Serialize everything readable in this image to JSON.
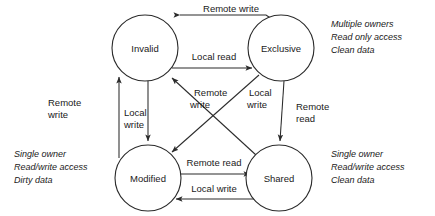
{
  "diagram": {
    "states": [
      {
        "id": "invalid",
        "label": "Invalid",
        "cx": 145,
        "cy": 48,
        "r": 33
      },
      {
        "id": "exclusive",
        "label": "Exclusive",
        "cx": 281,
        "cy": 48,
        "r": 33
      },
      {
        "id": "modified",
        "label": "Modified",
        "cx": 148,
        "cy": 178,
        "r": 33
      },
      {
        "id": "shared",
        "label": "Shared",
        "cx": 279,
        "cy": 178,
        "r": 33
      }
    ],
    "transitions": [
      {
        "id": "exclusive-to-invalid",
        "from": "exclusive",
        "to": "invalid",
        "label": "Remote write",
        "label_x": 231,
        "label_y": 12
      },
      {
        "id": "invalid-to-exclusive",
        "from": "invalid",
        "to": "exclusive",
        "label": "Local read",
        "label_x": 214,
        "label_y": 60
      },
      {
        "id": "modified-to-invalid",
        "from": "modified",
        "to": "invalid",
        "label": "Remote write",
        "label_x": 48,
        "label_y": 106
      },
      {
        "id": "invalid-to-modified",
        "from": "invalid",
        "to": "modified",
        "label": "Local write",
        "label_x": 124,
        "label_y": 116
      },
      {
        "id": "shared-to-invalid",
        "from": "shared",
        "to": "invalid",
        "label": "Remote write",
        "label_x": 194,
        "label_y": 96
      },
      {
        "id": "exclusive-to-modified",
        "from": "exclusive",
        "to": "modified",
        "label": "Local write",
        "label_x": 249,
        "label_y": 96
      },
      {
        "id": "exclusive-to-shared",
        "from": "exclusive",
        "to": "shared",
        "label": "Remote read",
        "label_x": 296,
        "label_y": 110
      },
      {
        "id": "modified-to-shared",
        "from": "modified",
        "to": "shared",
        "label": "Remote read",
        "label_x": 214,
        "label_y": 166
      },
      {
        "id": "shared-to-modified",
        "from": "shared",
        "to": "modified",
        "label": "Local write",
        "label_x": 214,
        "label_y": 192
      }
    ],
    "transition_label_lines": {
      "modified-to-invalid": [
        "Remote",
        "write"
      ],
      "invalid-to-modified": [
        "Local",
        "write"
      ],
      "shared-to-invalid": [
        "Remote",
        "write"
      ],
      "exclusive-to-modified": [
        "Local",
        "write"
      ],
      "exclusive-to-shared": [
        "Remote",
        "read"
      ]
    },
    "annotations": [
      {
        "id": "exclusive-note",
        "anchor": "top-right",
        "x": 331,
        "y": 27,
        "lines": [
          "Multiple owners",
          "Read only access",
          "Clean data"
        ]
      },
      {
        "id": "shared-note",
        "anchor": "bottom-right",
        "x": 331,
        "y": 157,
        "lines": [
          "Single owner",
          "Read/write access",
          "Clean data"
        ]
      },
      {
        "id": "modified-note",
        "anchor": "bottom-left",
        "x": 14,
        "y": 157,
        "lines": [
          "Single owner",
          "Read/write access",
          "Dirty data"
        ]
      }
    ],
    "colors": {
      "stroke": "#2b2b2b",
      "text": "#1a1a1a",
      "background": "#ffffff"
    }
  }
}
